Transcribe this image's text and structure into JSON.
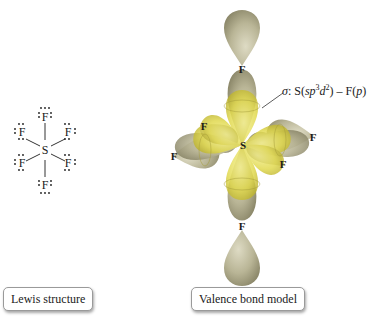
{
  "lewis_structure": {
    "central_atom": "S",
    "ligand_atoms": [
      "F",
      "F",
      "F",
      "F",
      "F",
      "F"
    ],
    "caption": "Lewis structure"
  },
  "valence_bond_model": {
    "central_atom": "S",
    "ligand_atoms": [
      "F",
      "F",
      "F",
      "F",
      "F",
      "F"
    ],
    "annotation": {
      "sigma": "σ",
      "prefix": ": S(",
      "hybrid_s": "sp",
      "hybrid_s_sup": "3",
      "hybrid_d": "d",
      "hybrid_d_sup": "2",
      "mid": ") – F(",
      "p": "p",
      "suffix": ")"
    },
    "caption": "Valence bond model"
  },
  "colors": {
    "lobe_fluorine": "#b9b596",
    "lobe_sulfur_hybrid": "#e4dc4a",
    "text": "#1a1a1a"
  }
}
